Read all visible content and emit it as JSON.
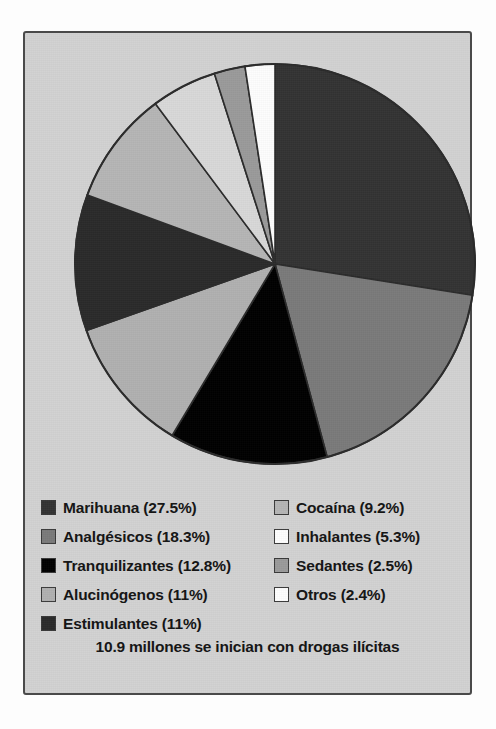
{
  "chart_data": {
    "type": "pie",
    "title": "10.9 millones se inician con drogas ilícitas",
    "xlabel": "",
    "ylabel": "",
    "legend_position": "bottom",
    "grid": false,
    "start_angle_deg": 0,
    "direction": "clockwise",
    "categories": [
      "Marihuana",
      "Analgésicos",
      "Tranquilizantes",
      "Alucinógenos",
      "Estimulantes",
      "Cocaína",
      "Inhalantes",
      "Sedantes",
      "Otros"
    ],
    "values": [
      27.5,
      18.3,
      12.8,
      11,
      11,
      9.2,
      5.3,
      2.5,
      2.4
    ],
    "value_unit": "%",
    "colors": [
      "#333333",
      "#7a7a7a",
      "#000000",
      "#b0b0b0",
      "#2a2a2a",
      "#b5b5b5",
      "#d8d8d8",
      "#9a9a9a",
      "#fdfdfd"
    ],
    "slice_border_color": "#2b2b2b"
  },
  "legend": {
    "left_column": [
      {
        "label": "Marihuana (27.5%)",
        "color": "#333333",
        "swatch_name": "legend-swatch-marihuana"
      },
      {
        "label": "Analgésicos (18.3%)",
        "color": "#7a7a7a",
        "swatch_name": "legend-swatch-analgesicos"
      },
      {
        "label": "Tranquilizantes (12.8%)",
        "color": "#000000",
        "swatch_name": "legend-swatch-tranquilizantes"
      },
      {
        "label": "Alucinógenos (11%)",
        "color": "#b0b0b0",
        "swatch_name": "legend-swatch-alucinogenos"
      },
      {
        "label": "Estimulantes (11%)",
        "color": "#2a2a2a",
        "swatch_name": "legend-swatch-estimulantes"
      }
    ],
    "right_column": [
      {
        "label": "Cocaína (9.2%)",
        "color": "#b5b5b5",
        "swatch_name": "legend-swatch-cocaina"
      },
      {
        "label": "Inhalantes (5.3%)",
        "color": "#fdfdfd",
        "swatch_name": "legend-swatch-inhalantes"
      },
      {
        "label": "Sedantes (2.5%)",
        "color": "#9a9a9a",
        "swatch_name": "legend-swatch-sedantes"
      },
      {
        "label": "Otros (2.4%)",
        "color": "#fdfdfd",
        "swatch_name": "legend-swatch-otros"
      }
    ]
  },
  "caption": {
    "text": "10.9 millones se inician con drogas ilícitas"
  },
  "panel": {
    "background_color": "#d2d2d2",
    "border_color": "#4a4a4a"
  }
}
